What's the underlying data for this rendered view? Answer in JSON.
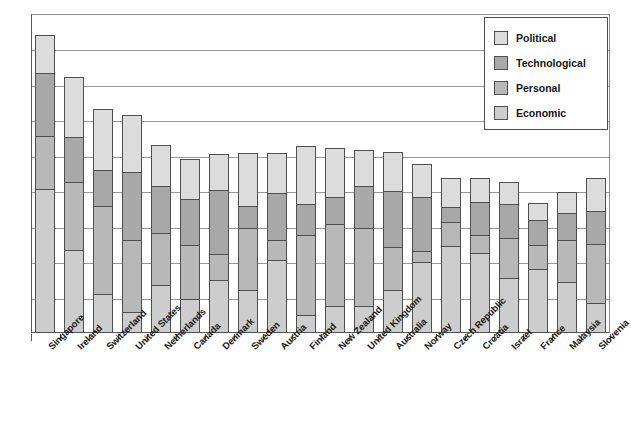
{
  "chart_data": {
    "type": "bar",
    "title": "",
    "subtitle": "",
    "xlabel": "",
    "ylabel": "",
    "stacked": true,
    "grid": true,
    "legend_position": "top-right",
    "ylim": [
      0,
      9
    ],
    "ytick_values": [
      0,
      1,
      2,
      3,
      4,
      5,
      6,
      7,
      8,
      9
    ],
    "ytick_labels": [],
    "categories": [
      "Singapore",
      "Ireland",
      "Switzerland",
      "United States",
      "Netherlands",
      "Canada",
      "Denmark",
      "Sweden",
      "Austria",
      "Finland",
      "New Zealand",
      "United Kingdom",
      "Australia",
      "Norway",
      "Czech Republic",
      "Croatia",
      "Israel",
      "France",
      "Malaysia",
      "Slovenia"
    ],
    "series": [
      {
        "name": "Economic",
        "color": "#cdcdcd",
        "values": [
          4.05,
          2.35,
          1.1,
          0.6,
          1.35,
          0.95,
          1.5,
          1.2,
          2.05,
          0.5,
          0.75,
          0.75,
          1.2,
          2.0,
          2.45,
          2.25,
          1.55,
          1.8,
          1.45,
          0.85
        ]
      },
      {
        "name": "Personal",
        "color": "#b8b8b8",
        "values": [
          1.55,
          1.95,
          2.5,
          2.05,
          1.5,
          1.55,
          0.75,
          1.8,
          0.6,
          2.3,
          2.35,
          2.25,
          1.25,
          0.35,
          0.7,
          0.55,
          1.15,
          0.7,
          1.2,
          1.7
        ]
      },
      {
        "name": "Technological",
        "color": "#a8a8a8",
        "values": [
          1.8,
          1.3,
          1.05,
          1.95,
          1.35,
          1.35,
          1.85,
          0.65,
          1.35,
          0.9,
          0.8,
          1.2,
          1.6,
          1.55,
          0.45,
          0.95,
          1.0,
          0.75,
          0.8,
          0.95
        ]
      },
      {
        "name": "Political",
        "color": "#dcdcdc",
        "values": [
          1.1,
          1.7,
          1.75,
          1.65,
          1.2,
          1.15,
          1.05,
          1.5,
          1.15,
          1.65,
          1.4,
          1.05,
          1.15,
          0.95,
          0.85,
          0.7,
          0.65,
          0.5,
          0.6,
          0.95
        ]
      }
    ]
  },
  "legend": {
    "items": [
      {
        "label": "Political",
        "color": "#dcdcdc"
      },
      {
        "label": "Technological",
        "color": "#a8a8a8"
      },
      {
        "label": "Personal",
        "color": "#b8b8b8"
      },
      {
        "label": "Economic",
        "color": "#cdcdcd"
      }
    ]
  },
  "axis": {
    "gridline_count": 8,
    "baseline_color": "#59595c",
    "gridline_color": "#98989b"
  }
}
